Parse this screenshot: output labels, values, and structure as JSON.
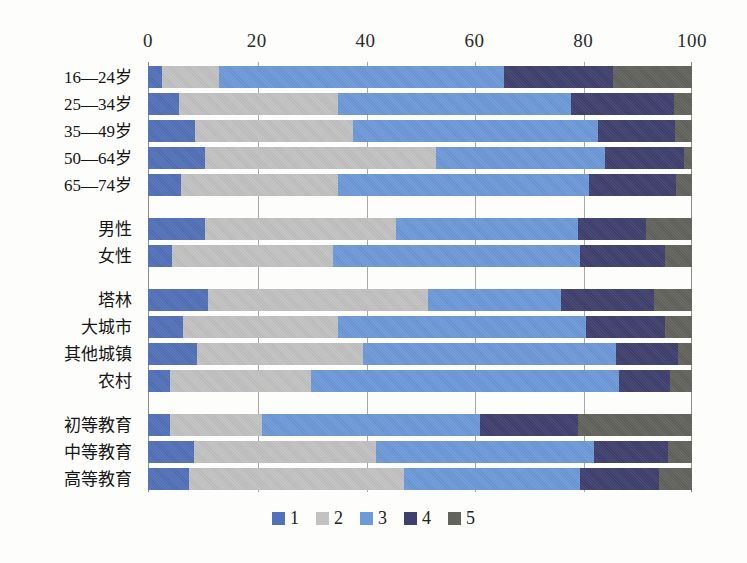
{
  "chart_data": {
    "type": "bar",
    "orientation": "horizontal",
    "stacked": true,
    "stack_mode": "percent",
    "title": "",
    "subtitle": "",
    "xlabel": "",
    "ylabel": "",
    "xlim": [
      0,
      100
    ],
    "xticks": [
      0,
      20,
      40,
      60,
      80,
      100
    ],
    "xtick_labels": [
      "0",
      "20",
      "40",
      "60",
      "80",
      "100"
    ],
    "grid": true,
    "grid_axis": "x",
    "legend_position": "bottom",
    "legend": [
      "1",
      "2",
      "3",
      "4",
      "5"
    ],
    "colors": [
      "#5371b8",
      "#c2c2c2",
      "#6d9ad8",
      "#40406e",
      "#61635c"
    ],
    "groups": [
      {
        "name": "age",
        "categories": [
          "16—24岁",
          "25—34岁",
          "35—49岁",
          "50—64岁",
          "65—74岁"
        ]
      },
      {
        "name": "gender",
        "categories": [
          "男性",
          "女性"
        ]
      },
      {
        "name": "settlement",
        "categories": [
          "塔林",
          "大城市",
          "其他城镇",
          "农村"
        ]
      },
      {
        "name": "education",
        "categories": [
          "初等教育",
          "中等教育",
          "高等教育"
        ]
      }
    ],
    "categories": [
      "16—24岁",
      "25—34岁",
      "35—49岁",
      "50—64岁",
      "65—74岁",
      "男性",
      "女性",
      "塔林",
      "大城市",
      "其他城镇",
      "农村",
      "初等教育",
      "中等教育",
      "高等教育"
    ],
    "series": [
      {
        "name": "1",
        "color": "#5371b8",
        "values": [
          2.5,
          6.0,
          9.5,
          10.5,
          6.0,
          10.5,
          4.5,
          11.0,
          6.5,
          9.0,
          4.0,
          4.0,
          8.5,
          7.5
        ]
      },
      {
        "name": "2",
        "color": "#c2c2c2",
        "values": [
          10.5,
          31.0,
          32.0,
          42.5,
          29.0,
          35.0,
          29.5,
          40.5,
          28.5,
          30.5,
          26.0,
          17.0,
          33.5,
          39.5
        ]
      },
      {
        "name": "3",
        "color": "#6d9ad8",
        "values": [
          52.5,
          45.5,
          49.5,
          31.0,
          46.0,
          33.5,
          45.5,
          24.5,
          45.5,
          46.5,
          56.5,
          40.0,
          40.0,
          32.5
        ]
      },
      {
        "name": "4",
        "color": "#40406e",
        "values": [
          20.0,
          20.0,
          15.5,
          14.5,
          16.0,
          12.5,
          15.5,
          17.0,
          14.5,
          11.5,
          9.5,
          18.0,
          13.5,
          14.5
        ]
      },
      {
        "name": "5",
        "color": "#61635c",
        "values": [
          14.5,
          3.5,
          3.5,
          1.5,
          3.0,
          8.5,
          5.0,
          7.0,
          5.0,
          2.5,
          4.0,
          21.0,
          4.5,
          6.0
        ]
      }
    ],
    "rows": [
      {
        "label": "16—24岁",
        "group": "age",
        "values": [
          2.5,
          10.5,
          52.5,
          20.0,
          14.5
        ]
      },
      {
        "label": "25—34岁",
        "group": "age",
        "values": [
          6.0,
          31.0,
          45.5,
          20.0,
          3.5
        ]
      },
      {
        "label": "35—49岁",
        "group": "age",
        "values": [
          9.5,
          32.0,
          49.5,
          15.5,
          3.5
        ]
      },
      {
        "label": "50—64岁",
        "group": "age",
        "values": [
          10.5,
          42.5,
          31.0,
          14.5,
          1.5
        ]
      },
      {
        "label": "65—74岁",
        "group": "age",
        "values": [
          6.0,
          29.0,
          46.0,
          16.0,
          3.0
        ]
      },
      {
        "label": "男性",
        "group": "gender",
        "values": [
          10.5,
          35.0,
          33.5,
          12.5,
          8.5
        ]
      },
      {
        "label": "女性",
        "group": "gender",
        "values": [
          4.5,
          29.5,
          45.5,
          15.5,
          5.0
        ]
      },
      {
        "label": "塔林",
        "group": "settlement",
        "values": [
          11.0,
          40.5,
          24.5,
          17.0,
          7.0
        ]
      },
      {
        "label": "大城市",
        "group": "settlement",
        "values": [
          6.5,
          28.5,
          45.5,
          14.5,
          5.0
        ]
      },
      {
        "label": "其他城镇",
        "group": "settlement",
        "values": [
          9.0,
          30.5,
          46.5,
          11.5,
          2.5
        ]
      },
      {
        "label": "农村",
        "group": "settlement",
        "values": [
          4.0,
          26.0,
          56.5,
          9.5,
          4.0
        ]
      },
      {
        "label": "初等教育",
        "group": "education",
        "values": [
          4.0,
          17.0,
          40.0,
          18.0,
          21.0
        ]
      },
      {
        "label": "中等教育",
        "group": "education",
        "values": [
          8.5,
          33.5,
          40.0,
          13.5,
          4.5
        ]
      },
      {
        "label": "高等教育",
        "group": "education",
        "values": [
          7.5,
          39.5,
          32.5,
          14.5,
          6.0
        ]
      }
    ]
  }
}
